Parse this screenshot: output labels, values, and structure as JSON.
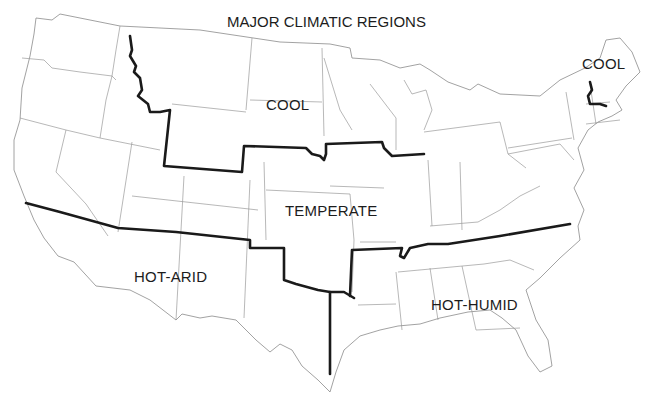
{
  "map": {
    "title": "MAJOR CLIMATIC REGIONS",
    "top_cut_text": "",
    "colors": {
      "background": "#ffffff",
      "state_lines": "#9a9a9a",
      "region_boundaries": "#1a1a1a",
      "label_text": "#1c1c1c"
    },
    "regions": [
      {
        "id": "cool-north",
        "label": "COOL"
      },
      {
        "id": "cool-northeast",
        "label": "COOL"
      },
      {
        "id": "temperate",
        "label": "TEMPERATE"
      },
      {
        "id": "hot-arid",
        "label": "HOT-ARID"
      },
      {
        "id": "hot-humid",
        "label": "HOT-HUMID"
      }
    ]
  }
}
